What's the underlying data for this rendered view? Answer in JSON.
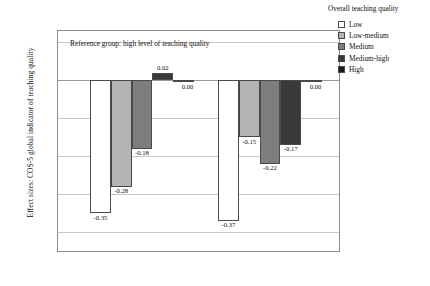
{
  "chart_data": {
    "type": "bar",
    "title": "",
    "xlabel": "",
    "ylabel": "Effect sizes: COS-5 global indicator of teaching quality",
    "categories": [
      "Mathematics",
      "Reading"
    ],
    "series": [
      {
        "name": "Low",
        "values": [
          -0.35,
          -0.37
        ],
        "color": "#ffffff"
      },
      {
        "name": "Low-medium",
        "values": [
          -0.28,
          -0.15
        ],
        "color": "#b4b4b4"
      },
      {
        "name": "Medium",
        "values": [
          -0.18,
          -0.22
        ],
        "color": "#7d7d7d"
      },
      {
        "name": "Medium-high",
        "values": [
          0.02,
          -0.17
        ],
        "color": "#3a3a3a"
      },
      {
        "name": "High",
        "values": [
          0.0,
          0.0
        ],
        "color": "#1a1a1a"
      }
    ],
    "value_labels": [
      [
        "-0.35",
        "-0.28",
        "-0.18",
        "0.02",
        "0.00"
      ],
      [
        "-0.37",
        "-0.15",
        "-0.22",
        "-0.17",
        "0.00"
      ]
    ],
    "ylim": [
      -0.45,
      0.13
    ],
    "yticks": [
      0.1,
      0.0,
      -0.1,
      -0.2,
      -0.3,
      -0.4
    ],
    "ytick_labels": [
      "0.10",
      "0.00",
      "-0.10",
      "-0.20",
      "-0.30",
      "-0.40"
    ],
    "grid": true,
    "legend_position": "right",
    "annotation": "Reference group: high level of teaching quality"
  },
  "legend": {
    "title": "Overall teaching quality"
  }
}
